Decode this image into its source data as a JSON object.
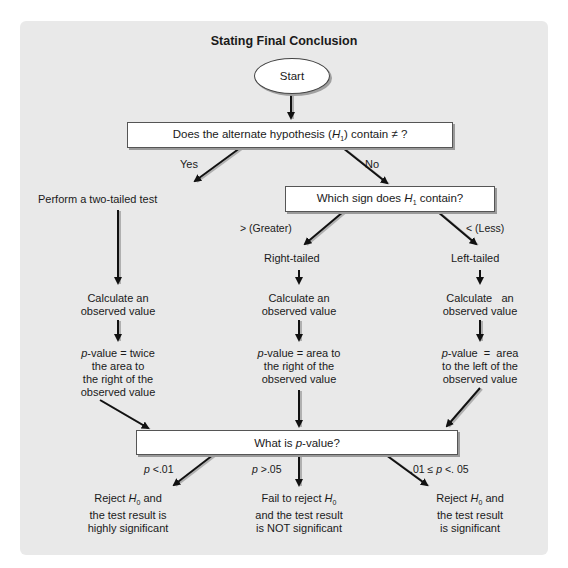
{
  "title": "Stating Final Conclusion",
  "start": "Start",
  "q1": {
    "pre": "Does the alternate hypothesis (",
    "var": "H",
    "sub": "1",
    "post": ") contain ≠ ?"
  },
  "q1_yes": "Yes",
  "q1_no": "No",
  "two_tailed": "Perform a two-tailed test",
  "q2": {
    "pre": "Which sign does ",
    "var": "H",
    "sub": "1",
    "post": " contain?"
  },
  "greater_label": "> (Greater)",
  "less_label": "< (Less)",
  "right_tailed": "Right-tailed",
  "left_tailed": "Left-tailed",
  "calc": {
    "left": [
      "Calculate an",
      "observed value"
    ],
    "middle": [
      "Calculate an",
      "observed value"
    ],
    "right": [
      "Calculate   an",
      "observed value"
    ]
  },
  "pval": {
    "left": {
      "p": "p",
      "lines": [
        "-value = twice",
        "the area to",
        "the right of the",
        "observed value"
      ]
    },
    "middle": {
      "p": "p",
      "lines": [
        "-value = area to",
        "the right of the",
        "observed value"
      ]
    },
    "right": {
      "p": "p",
      "lines": [
        "-value  =  area",
        "to the left of the",
        "observed value"
      ]
    }
  },
  "q3": {
    "pre": "What is ",
    "var": "p",
    "post": "-value?"
  },
  "cond": {
    "left": {
      "p": "p",
      "rest": " <.01"
    },
    "middle": {
      "p": "p",
      "rest": " >.05"
    },
    "right": {
      "pre": ".01 ≤ ",
      "p": "p",
      "rest": " <. 05"
    }
  },
  "outcomes": {
    "left": {
      "l1pre": "Reject ",
      "h": "H",
      "sub": "0",
      "l1post": " and",
      "l2": "the test result is",
      "l3": "highly significant"
    },
    "middle": {
      "l1pre": "Fail to reject ",
      "h": "H",
      "sub": "0",
      "l2": "and the test result",
      "l3": "is NOT significant"
    },
    "right": {
      "l1pre": "Reject ",
      "h": "H",
      "sub": "0",
      "l1post": " and",
      "l2": "the test result",
      "l3": "is significant"
    }
  },
  "colors": {
    "panel": "#e9e9e9",
    "box": "#ffffff",
    "arrow": "#111111",
    "shadow": "#9a9a9a"
  }
}
